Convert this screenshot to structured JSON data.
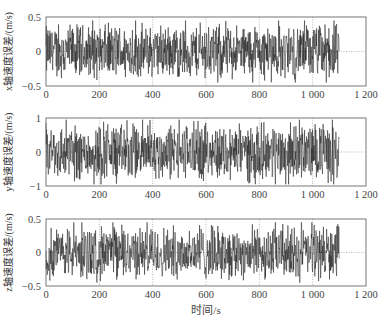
{
  "chart_data": [
    {
      "type": "line",
      "title": "",
      "xlabel": "时间/s",
      "ylabel": "x轴速度误差/(m/s)",
      "xlim": [
        0,
        1200
      ],
      "ylim": [
        -0.5,
        0.5
      ],
      "xticks": [
        0,
        200,
        400,
        600,
        800,
        1000,
        1200
      ],
      "xtick_labels": [
        "0",
        "200",
        "400",
        "600",
        "800",
        "1 000",
        "1 200"
      ],
      "yticks": [
        -0.5,
        0,
        0.5
      ],
      "ytick_labels": [
        "−0.5",
        "0",
        "0.5"
      ],
      "grid": "dotted",
      "series": [
        {
          "name": "x-axis velocity error",
          "x_range": [
            0,
            1100
          ],
          "amplitude": 0.45,
          "description": "noise-like signal centered at 0"
        }
      ]
    },
    {
      "type": "line",
      "title": "",
      "xlabel": "时间/s",
      "ylabel": "y轴速度误差/(m/s)",
      "xlim": [
        0,
        1200
      ],
      "ylim": [
        -1,
        1
      ],
      "xticks": [
        0,
        200,
        400,
        600,
        800,
        1000,
        1200
      ],
      "xtick_labels": [
        "0",
        "200",
        "400",
        "600",
        "800",
        "1 000",
        "1 200"
      ],
      "yticks": [
        -1,
        0,
        1
      ],
      "ytick_labels": [
        "−1",
        "0",
        "1"
      ],
      "grid": "dotted",
      "series": [
        {
          "name": "y-axis velocity error",
          "x_range": [
            0,
            1100
          ],
          "amplitude": 0.95,
          "description": "noise-like signal centered at 0"
        }
      ]
    },
    {
      "type": "line",
      "title": "",
      "xlabel": "时间/s",
      "ylabel": "z轴速度误差/(m/s)",
      "xlim": [
        0,
        1200
      ],
      "ylim": [
        -0.5,
        0.5
      ],
      "xticks": [
        0,
        200,
        400,
        600,
        800,
        1000,
        1200
      ],
      "xtick_labels": [
        "0",
        "200",
        "400",
        "600",
        "800",
        "1 000",
        "1 200"
      ],
      "yticks": [
        -0.5,
        0,
        0.5
      ],
      "ytick_labels": [
        "−0.5",
        "0",
        "0.5"
      ],
      "grid": "dotted",
      "series": [
        {
          "name": "z-axis velocity error",
          "x_range": [
            0,
            1100
          ],
          "amplitude": 0.45,
          "description": "noise-like signal centered at 0"
        }
      ]
    }
  ],
  "figure": {
    "xlabel": "时间/s",
    "panels": [
      {
        "ylabel": "x轴速度误差/(m/s)",
        "yticks": [
          "0.5",
          "0",
          "−0.5"
        ]
      },
      {
        "ylabel": "y轴速度误差/(m/s)",
        "yticks": [
          "1",
          "0",
          "−1"
        ]
      },
      {
        "ylabel": "z轴速度误差/(m/s)",
        "yticks": [
          "0.5",
          "0",
          "−0.5"
        ]
      }
    ],
    "xtick_labels": [
      "0",
      "200",
      "400",
      "600",
      "800",
      "1 000",
      "1 200"
    ],
    "colors": {
      "signal": "#1a1a1a",
      "axis": "#555555",
      "grid": "#888888"
    }
  }
}
